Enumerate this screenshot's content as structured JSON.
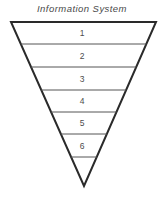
{
  "diagram": {
    "title": "Information System",
    "type": "inverted-triangle-funnel",
    "shape": {
      "top_left_x": 11,
      "top_right_x": 156,
      "top_y": 22,
      "apex_x": 84,
      "apex_y": 186,
      "outline_color": "#2a2a2a",
      "outline_width": 2,
      "fill_color": "#ffffff",
      "divider_color": "#555555",
      "divider_width": 1,
      "divider_y_values": [
        44,
        67,
        90,
        112,
        134,
        157
      ]
    },
    "levels": [
      {
        "label": "1",
        "center_y": 33
      },
      {
        "label": "2",
        "center_y": 55.5
      },
      {
        "label": "3",
        "center_y": 78.5
      },
      {
        "label": "4",
        "center_y": 101
      },
      {
        "label": "5",
        "center_y": 123
      },
      {
        "label": "6",
        "center_y": 145.5
      }
    ]
  }
}
